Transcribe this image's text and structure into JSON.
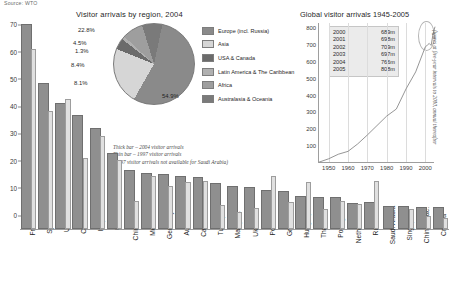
{
  "source": "Source: WTO",
  "bar_chart": {
    "note_lines": [
      "Thick bar – 2004 visitor arrivals",
      "Thin bar – 1997 visitor arrivals",
      "(1997 visitor arrivals not available for Saudi Arabia)"
    ]
  },
  "pie": {
    "title": "Visitor arrivals by region, 2004"
  },
  "line": {
    "title": "Global visitor arrivals 1945-2005",
    "side_label": "figures at five-year intervals to 2000, annual thereafter"
  },
  "chart_data": [
    {
      "type": "bar",
      "title": "",
      "xlabel": "",
      "ylabel": "",
      "ylim": [
        0,
        76
      ],
      "yticks": [
        0,
        10,
        20,
        30,
        40,
        50,
        60,
        70
      ],
      "grid": false,
      "categories": [
        "France",
        "Spain",
        "USA",
        "China",
        "Italy",
        "UK",
        "China: HK",
        "Mexico",
        "Germany",
        "Austria",
        "Canada",
        "Turkey",
        "Malaysia",
        "Ukraine",
        "Poland",
        "Greece",
        "Hungary",
        "Thailand",
        "Portugal",
        "Netherlands",
        "Russia",
        "Saudi Arabia",
        "Singapore",
        "China: Mac.",
        "Croatia"
      ],
      "series": [
        {
          "name": "2004 visitor arrivals",
          "color": "#8f8f8f",
          "values": [
            75.1,
            53.6,
            46.1,
            41.8,
            37.1,
            27.8,
            21.8,
            20.6,
            20.1,
            19.4,
            19.2,
            16.8,
            15.7,
            15.6,
            14.3,
            14.0,
            12.2,
            11.7,
            11.6,
            9.6,
            9.8,
            8.6,
            8.3,
            8.0,
            7.9
          ]
        },
        {
          "name": "1997 visitor arrivals",
          "color": "#e0e0e0",
          "values": [
            66.0,
            43.4,
            47.8,
            26.0,
            34.1,
            25.5,
            10.4,
            19.4,
            15.8,
            17.2,
            17.6,
            9.0,
            6.2,
            7.8,
            19.5,
            10.1,
            17.2,
            7.2,
            10.2,
            9.1,
            17.5,
            null,
            7.2,
            4.8,
            4.0
          ]
        }
      ],
      "dot_colors": [
        "#8a8a8a",
        "#7d7d7d",
        "#6f6f6f",
        "#8a8a8a",
        "#6f6f6f",
        "#7d7d7d",
        "#8a8a8a",
        "#c9c9c9",
        "#6f6f6f",
        "#8a8a8a",
        "#6f6f6f",
        "#8a8a8a",
        "#b5b5b5",
        "#6f6f6f",
        "#7d7d7d",
        "#6f6f6f",
        "#8a8a8a",
        "#b5b5b5",
        "#7d7d7d",
        "#6f6f6f",
        "#6f6f6f",
        "#b5b5b5",
        "#c0c0c0",
        "#b5b5b5",
        "#6f6f6f"
      ]
    },
    {
      "type": "pie",
      "title": "Visitor arrivals by region, 2004",
      "legend_position": "right",
      "labels": [
        "Europe (incl. Russia)",
        "Asia",
        "USA & Canada",
        "Latin America & The Caribbean",
        "Africa",
        "Australasia & Oceania"
      ],
      "values": [
        54.9,
        22.8,
        4.5,
        1.3,
        8.4,
        8.1
      ],
      "value_labels": [
        "54.9%",
        "22.8%",
        "4.5%",
        "1.3%",
        "8.4%",
        "8.1%"
      ],
      "colors": [
        "#8a8a8a",
        "#d6d6d6",
        "#6b6b6b",
        "#b0b0b0",
        "#9e9e9e",
        "#7a7a7a"
      ]
    },
    {
      "type": "line",
      "title": "Global visitor arrivals 1945-2005",
      "xlabel": "",
      "ylabel": "",
      "xlim": [
        1945,
        2005
      ],
      "ylim": [
        0,
        830
      ],
      "yticks": [
        100,
        200,
        300,
        400,
        500,
        600,
        700,
        800
      ],
      "xticks": [
        1950,
        1960,
        1970,
        1980,
        1990,
        2000
      ],
      "grid": true,
      "line_color": "#8a8a8a",
      "x": [
        1945,
        1950,
        1955,
        1960,
        1965,
        1970,
        1975,
        1980,
        1985,
        1990,
        1995,
        2000,
        2001,
        2002,
        2003,
        2004,
        2005
      ],
      "y": [
        5,
        25,
        52,
        69,
        113,
        166,
        222,
        278,
        320,
        439,
        540,
        689,
        698,
        709,
        697,
        766,
        808
      ],
      "annotation_table": {
        "rows": [
          {
            "year": "2000",
            "value": "689m"
          },
          {
            "year": "2001",
            "value": "698m"
          },
          {
            "year": "2002",
            "value": "709m"
          },
          {
            "year": "2003",
            "value": "697m"
          },
          {
            "year": "2004",
            "value": "766m"
          },
          {
            "year": "2005",
            "value": "808m"
          }
        ]
      },
      "side_note": "figures at five-year intervals to 2000, annual thereafter"
    }
  ]
}
